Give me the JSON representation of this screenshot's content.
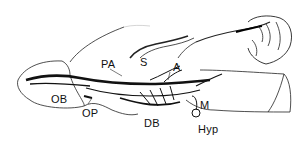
{
  "figure": {
    "labels": {
      "pa": "PA",
      "s": "S",
      "a": "A",
      "ob": "OB",
      "op": "OP",
      "db": "DB",
      "m": "M",
      "hyp": "Hyp"
    }
  }
}
